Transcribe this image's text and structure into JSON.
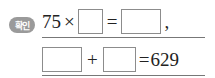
{
  "badge": {
    "label": "확인",
    "color": "#9a9a9a"
  },
  "equation1": {
    "left_operand": "75",
    "times": "×",
    "equals": "=",
    "trailing": ","
  },
  "equation2": {
    "plus": "+",
    "equals": "=",
    "result": "629"
  }
}
